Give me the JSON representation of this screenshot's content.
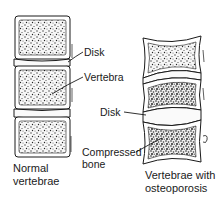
{
  "diagram": {
    "labels": {
      "disk_left": "Disk",
      "vertebra": "Vertebra",
      "disk_right": "Disk",
      "compressed_1": "Compressed",
      "compressed_2": "bone"
    },
    "captions": {
      "normal_1": "Normal",
      "normal_2": "vertebrae",
      "osteo_1": "Vertebrae with",
      "osteo_2": "osteoporosis"
    },
    "colors": {
      "ink": "#1a1a1a",
      "background": "#ffffff",
      "bone_fill": "#f4f4f4"
    }
  }
}
